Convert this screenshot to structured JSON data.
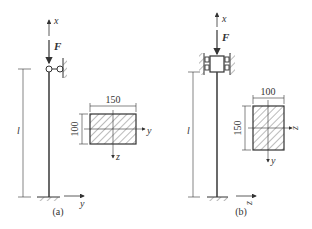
{
  "figure": {
    "panels": [
      {
        "id": "a",
        "caption": "(a)",
        "top_support": "pin-roller",
        "axis_x_label": "x",
        "force_label": "F",
        "length_label": "l",
        "base_axis_label": "y",
        "section": {
          "width_label": "150",
          "height_label": "100",
          "horizontal_axis_label": "y",
          "vertical_axis_label": "z"
        }
      },
      {
        "id": "b",
        "caption": "(b)",
        "top_support": "guided-sleeve",
        "axis_x_label": "x",
        "force_label": "F",
        "length_label": "l",
        "base_axis_label": "z",
        "section": {
          "width_label": "100",
          "height_label": "150",
          "horizontal_axis_label": "z",
          "vertical_axis_label": "y"
        }
      }
    ],
    "colors": {
      "line": "#333333",
      "hatch": "#555555"
    }
  }
}
